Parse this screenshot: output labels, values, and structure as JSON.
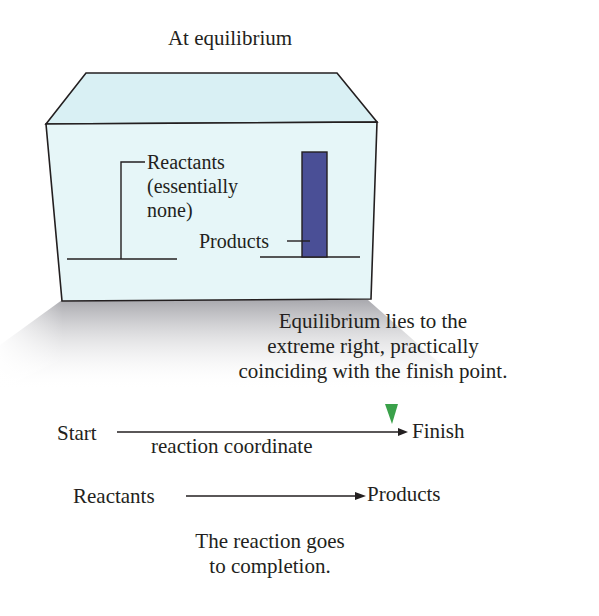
{
  "figure": {
    "title": "At equilibrium",
    "box": {
      "front_color": "#e6f6f8",
      "top_color": "#d9f0f4",
      "outline_color": "#231f20",
      "shadow_color": "#b8b8bc"
    },
    "bars": {
      "reactants": {
        "label_line1": "Reactants",
        "label_line2": "(essentially",
        "label_line3": "none)",
        "height": 0
      },
      "products": {
        "label": "Products",
        "color": "#4a4f96",
        "height": 103
      }
    },
    "equilibrium_note": {
      "line1": "Equilibrium lies to the",
      "line2": "extreme right, practically",
      "line3": "coinciding with the finish point."
    },
    "reaction_coordinate": {
      "start": "Start",
      "finish": "Finish",
      "axis_label": "reaction coordinate",
      "marker_color": "#3aa14a",
      "marker_position": "near finish"
    },
    "reaction": {
      "reactants": "Reactants",
      "products": "Products"
    },
    "conclusion": {
      "line1": "The reaction goes",
      "line2": "to completion."
    }
  }
}
